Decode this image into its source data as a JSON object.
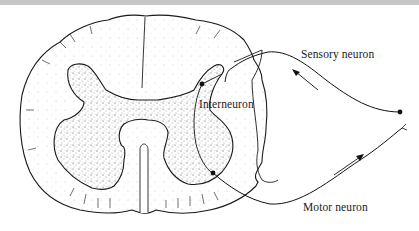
{
  "figure": {
    "labels": {
      "sensory": "Sensory neuron",
      "interneuron": "Interneuron",
      "motor": "Motor neuron"
    },
    "colors": {
      "ink": "#1a1a1a",
      "stipple": "#555555",
      "background": "#ffffff",
      "top_band": "#c6c6c6"
    }
  }
}
